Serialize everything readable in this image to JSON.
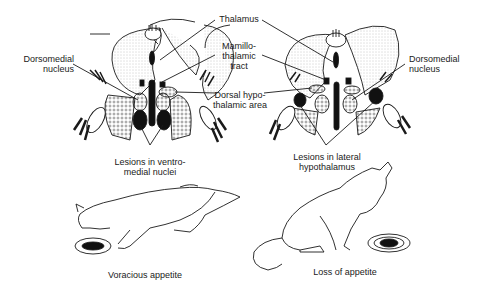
{
  "diagram": {
    "labels": {
      "thalamus": "Thalamus",
      "mamillothalamic_tract": "Mamillo-\nthalamic\ntract",
      "dorsal_hypothalamic_area": "Dorsal hypo-\nthalamic area",
      "dorsomedial_left": "Dorsomedial\nnucleus",
      "dorsomedial_right": "Dorsomedial\nnucleus",
      "lesions_vmh": "Lesions in ventro-\nmedial nuclei",
      "lesions_lh": "Lesions in lateral\nhypothalamus"
    },
    "panels": [
      {
        "caption": "Voracious appetite"
      },
      {
        "caption": "Loss of appetite"
      }
    ]
  }
}
